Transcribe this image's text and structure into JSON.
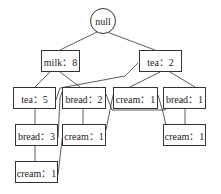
{
  "root": {
    "label": "null"
  },
  "nodes": [
    {
      "id": "milk8",
      "label": "milk：8"
    },
    {
      "id": "tea2",
      "label": "tea：2"
    },
    {
      "id": "tea5",
      "label": "tea：5"
    },
    {
      "id": "bread2",
      "label": "bread：2"
    },
    {
      "id": "cream1a",
      "label": "cream：1"
    },
    {
      "id": "bread1",
      "label": "bread：1"
    },
    {
      "id": "bread3",
      "label": "bread：3"
    },
    {
      "id": "cream1b",
      "label": "cream：1"
    },
    {
      "id": "cream1c",
      "label": "cream：1"
    },
    {
      "id": "cream1d",
      "label": "cream：1"
    }
  ],
  "edges": [
    [
      "null",
      "milk8"
    ],
    [
      "null",
      "tea2"
    ],
    [
      "milk8",
      "tea5"
    ],
    [
      "milk8",
      "bread2"
    ],
    [
      "tea2",
      "cream1a"
    ],
    [
      "tea2",
      "bread1"
    ],
    [
      "tea5",
      "bread3"
    ],
    [
      "bread3",
      "cream1d"
    ],
    [
      "bread2",
      "cream1b"
    ],
    [
      "bread1",
      "cream1c"
    ]
  ],
  "links": [
    {
      "item": "tea",
      "from": "tea5",
      "to": "tea2"
    },
    {
      "item": "bread",
      "from": "bread3",
      "to": "bread2"
    },
    {
      "item": "bread",
      "from": "bread2",
      "to": "bread1"
    },
    {
      "item": "cream",
      "from": "cream1d",
      "to": "cream1b"
    },
    {
      "item": "cream",
      "from": "cream1b",
      "to": "cream1a"
    },
    {
      "item": "cream",
      "from": "cream1a",
      "to": "cream1c"
    }
  ]
}
